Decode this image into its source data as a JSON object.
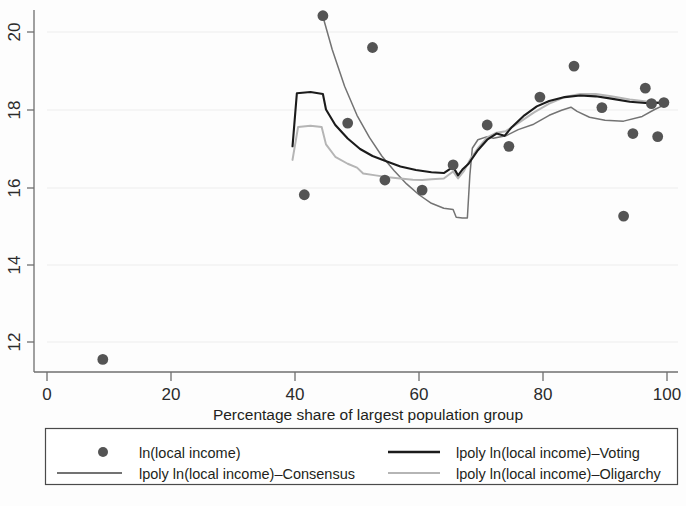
{
  "chart_data": {
    "type": "scatter",
    "title": "",
    "subtitle": "",
    "xlabel": "Percentage share of largest population group",
    "ylabel": "",
    "xlim": [
      0,
      104
    ],
    "ylim": [
      11.0,
      20.9
    ],
    "xticks": [
      0,
      20,
      40,
      60,
      80,
      100
    ],
    "xtick_labels": [
      "0",
      "20",
      "40",
      "60",
      "80",
      "100"
    ],
    "yticks": [
      12,
      14,
      16,
      18,
      20
    ],
    "ytick_labels": [
      "12",
      "14",
      "16",
      "18",
      "20"
    ],
    "grid": "faint-horizontal",
    "legend_position": "below-plot",
    "colors": {
      "scatter": "#545454",
      "voting": "#1b1b1b",
      "consensus": "#737373",
      "oligarchy": "#b5b5b5",
      "axis": "#6f6f6f",
      "text": "#231f20",
      "background": "#ffffff"
    },
    "series": [
      {
        "name": "ln(local income)",
        "type": "scatter",
        "marker": "filled-circle",
        "color": "#545454",
        "points": [
          [
            9.0,
            11.55
          ],
          [
            41.5,
            15.8
          ],
          [
            44.5,
            20.42
          ],
          [
            48.5,
            17.65
          ],
          [
            52.5,
            19.6
          ],
          [
            54.5,
            16.18
          ],
          [
            60.5,
            15.92
          ],
          [
            65.5,
            16.57
          ],
          [
            71.0,
            17.6
          ],
          [
            74.5,
            17.05
          ],
          [
            79.5,
            18.32
          ],
          [
            85.0,
            19.12
          ],
          [
            89.5,
            18.05
          ],
          [
            93.0,
            15.25
          ],
          [
            94.5,
            17.38
          ],
          [
            96.5,
            18.55
          ],
          [
            97.5,
            18.15
          ],
          [
            98.5,
            17.3
          ],
          [
            99.5,
            18.18
          ]
        ]
      },
      {
        "name": "lpoly ln(local income)-Voting",
        "type": "line",
        "color": "#1b1b1b",
        "points": [
          [
            39.6,
            17.05
          ],
          [
            40.3,
            18.42
          ],
          [
            42.5,
            18.45
          ],
          [
            44.5,
            18.4
          ],
          [
            45.0,
            18.0
          ],
          [
            46.5,
            17.6
          ],
          [
            48.5,
            17.25
          ],
          [
            50.5,
            16.98
          ],
          [
            52.5,
            16.8
          ],
          [
            54.5,
            16.68
          ],
          [
            57.0,
            16.53
          ],
          [
            59.5,
            16.44
          ],
          [
            62.0,
            16.38
          ],
          [
            64.0,
            16.36
          ],
          [
            65.5,
            16.52
          ],
          [
            66.3,
            16.3
          ],
          [
            67.0,
            16.45
          ],
          [
            68.0,
            16.6
          ],
          [
            69.5,
            16.95
          ],
          [
            71.0,
            17.22
          ],
          [
            72.5,
            17.38
          ],
          [
            73.8,
            17.32
          ],
          [
            75.0,
            17.55
          ],
          [
            77.0,
            17.85
          ],
          [
            79.0,
            18.08
          ],
          [
            81.0,
            18.22
          ],
          [
            83.5,
            18.32
          ],
          [
            86.0,
            18.36
          ],
          [
            88.5,
            18.34
          ],
          [
            91.0,
            18.28
          ],
          [
            94.0,
            18.2
          ],
          [
            97.0,
            18.16
          ],
          [
            100.0,
            18.18
          ]
        ]
      },
      {
        "name": "lpoly ln(local income)-Consensus",
        "type": "line",
        "color": "#737373",
        "points": [
          [
            44.5,
            20.4
          ],
          [
            46.0,
            19.55
          ],
          [
            48.0,
            18.6
          ],
          [
            50.0,
            17.85
          ],
          [
            52.0,
            17.28
          ],
          [
            54.0,
            16.8
          ],
          [
            56.0,
            16.42
          ],
          [
            58.0,
            16.08
          ],
          [
            60.0,
            15.8
          ],
          [
            62.0,
            15.58
          ],
          [
            64.0,
            15.45
          ],
          [
            65.5,
            15.42
          ],
          [
            66.0,
            15.22
          ],
          [
            67.0,
            15.2
          ],
          [
            67.8,
            15.2
          ],
          [
            68.2,
            16.3
          ],
          [
            68.6,
            17.0
          ],
          [
            69.5,
            17.22
          ],
          [
            71.0,
            17.3
          ],
          [
            72.0,
            17.26
          ],
          [
            74.0,
            17.32
          ],
          [
            76.0,
            17.48
          ],
          [
            78.5,
            17.62
          ],
          [
            81.0,
            17.85
          ],
          [
            83.0,
            17.98
          ],
          [
            84.5,
            18.06
          ],
          [
            85.5,
            17.95
          ],
          [
            87.5,
            17.8
          ],
          [
            90.0,
            17.72
          ],
          [
            93.0,
            17.7
          ],
          [
            96.0,
            17.82
          ],
          [
            98.0,
            18.0
          ],
          [
            100.0,
            18.15
          ]
        ]
      },
      {
        "name": "lpoly ln(local income)-Oligarchy",
        "type": "line",
        "color": "#b5b5b5",
        "points": [
          [
            39.6,
            16.7
          ],
          [
            40.5,
            17.55
          ],
          [
            42.5,
            17.58
          ],
          [
            44.3,
            17.55
          ],
          [
            45.0,
            17.1
          ],
          [
            46.5,
            16.78
          ],
          [
            48.5,
            16.6
          ],
          [
            50.0,
            16.5
          ],
          [
            51.0,
            16.35
          ],
          [
            53.0,
            16.3
          ],
          [
            55.0,
            16.25
          ],
          [
            57.0,
            16.22
          ],
          [
            59.0,
            16.19
          ],
          [
            60.5,
            16.18
          ],
          [
            62.0,
            16.2
          ],
          [
            64.0,
            16.22
          ],
          [
            65.5,
            16.4
          ],
          [
            66.3,
            16.22
          ],
          [
            67.2,
            16.4
          ],
          [
            68.2,
            16.7
          ],
          [
            69.5,
            17.0
          ],
          [
            71.0,
            17.28
          ],
          [
            72.5,
            17.4
          ],
          [
            74.0,
            17.44
          ],
          [
            76.0,
            17.65
          ],
          [
            78.5,
            17.92
          ],
          [
            81.0,
            18.15
          ],
          [
            83.5,
            18.32
          ],
          [
            86.0,
            18.4
          ],
          [
            88.5,
            18.4
          ],
          [
            91.0,
            18.34
          ],
          [
            94.0,
            18.26
          ],
          [
            97.0,
            18.2
          ],
          [
            100.0,
            18.18
          ]
        ]
      }
    ],
    "legend": {
      "entries": [
        {
          "label": "ln(local income)",
          "marker": "circle",
          "color": "#545454"
        },
        {
          "label": "lpoly ln(local income)–Voting",
          "marker": "line",
          "color": "#1b1b1b"
        },
        {
          "label": "lpoly ln(local income)–Consensus",
          "marker": "line",
          "color": "#737373"
        },
        {
          "label": "lpoly ln(local income)–Oligarchy",
          "marker": "line",
          "color": "#b5b5b5"
        }
      ]
    }
  }
}
